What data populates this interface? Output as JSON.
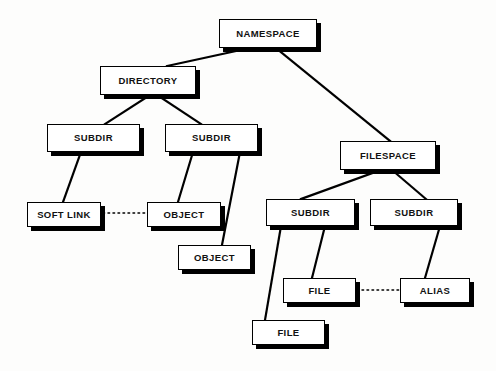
{
  "diagram": {
    "background_color": "#fdfdfc",
    "node_fill_color": "#ffffff",
    "node_border_color": "#000000",
    "node_shadow_color": "#000000",
    "edge_color": "#000000",
    "nodes": [
      {
        "id": "namespace",
        "label": "NAMESPACE",
        "x": 219,
        "y": 19,
        "w": 98,
        "h": 29
      },
      {
        "id": "directory",
        "label": "DIRECTORY",
        "x": 100,
        "y": 66,
        "w": 96,
        "h": 29
      },
      {
        "id": "subdir-a",
        "label": "SUBDIR",
        "x": 47,
        "y": 124,
        "w": 93,
        "h": 28
      },
      {
        "id": "subdir-b",
        "label": "SUBDIR",
        "x": 165,
        "y": 124,
        "w": 93,
        "h": 28
      },
      {
        "id": "filespace",
        "label": "FILESPACE",
        "x": 340,
        "y": 141,
        "w": 96,
        "h": 29
      },
      {
        "id": "soft-link",
        "label": "SOFT LINK",
        "x": 27,
        "y": 202,
        "w": 74,
        "h": 25
      },
      {
        "id": "object-a",
        "label": "OBJECT",
        "x": 147,
        "y": 202,
        "w": 74,
        "h": 25
      },
      {
        "id": "subdir-c",
        "label": "SUBDIR",
        "x": 266,
        "y": 199,
        "w": 89,
        "h": 27
      },
      {
        "id": "subdir-d",
        "label": "SUBDIR",
        "x": 370,
        "y": 199,
        "w": 88,
        "h": 27
      },
      {
        "id": "object-b",
        "label": "OBJECT",
        "x": 178,
        "y": 245,
        "w": 73,
        "h": 25
      },
      {
        "id": "file-a",
        "label": "FILE",
        "x": 283,
        "y": 278,
        "w": 73,
        "h": 25
      },
      {
        "id": "alias",
        "label": "ALIAS",
        "x": 400,
        "y": 278,
        "w": 70,
        "h": 25
      },
      {
        "id": "file-b",
        "label": "FILE",
        "x": 252,
        "y": 320,
        "w": 73,
        "h": 25
      }
    ],
    "edges": [
      {
        "id": "namespace-directory",
        "from": "namespace",
        "to": "directory",
        "style": "solid",
        "x1": 250,
        "y1": 48,
        "x2": 167,
        "y2": 66
      },
      {
        "id": "namespace-filespace",
        "from": "namespace",
        "to": "filespace",
        "style": "solid",
        "x1": 276,
        "y1": 48,
        "x2": 390,
        "y2": 141
      },
      {
        "id": "directory-subdir-a",
        "from": "directory",
        "to": "subdir-a",
        "style": "solid",
        "x1": 150,
        "y1": 95,
        "x2": 105,
        "y2": 124
      },
      {
        "id": "directory-subdir-b",
        "from": "directory",
        "to": "subdir-b",
        "style": "solid",
        "x1": 157,
        "y1": 95,
        "x2": 201,
        "y2": 124
      },
      {
        "id": "subdir-a-soft-link",
        "from": "subdir-a",
        "to": "soft-link",
        "style": "solid",
        "x1": 81,
        "y1": 152,
        "x2": 63,
        "y2": 202
      },
      {
        "id": "subdir-b-object-a",
        "from": "subdir-b",
        "to": "object-a",
        "style": "solid",
        "x1": 193,
        "y1": 152,
        "x2": 178,
        "y2": 202
      },
      {
        "id": "subdir-b-object-b",
        "from": "subdir-b",
        "to": "object-b",
        "style": "solid",
        "x1": 240,
        "y1": 152,
        "x2": 222,
        "y2": 245
      },
      {
        "id": "filespace-subdir-c",
        "from": "filespace",
        "to": "subdir-c",
        "style": "solid",
        "x1": 381,
        "y1": 170,
        "x2": 301,
        "y2": 199
      },
      {
        "id": "filespace-subdir-d",
        "from": "filespace",
        "to": "subdir-d",
        "style": "solid",
        "x1": 392,
        "y1": 170,
        "x2": 426,
        "y2": 199
      },
      {
        "id": "subdir-c-file-b",
        "from": "subdir-c",
        "to": "file-b",
        "style": "solid",
        "x1": 281,
        "y1": 226,
        "x2": 265,
        "y2": 320
      },
      {
        "id": "subdir-c-file-a",
        "from": "subdir-c",
        "to": "file-a",
        "style": "solid",
        "x1": 325,
        "y1": 226,
        "x2": 312,
        "y2": 278
      },
      {
        "id": "subdir-d-alias",
        "from": "subdir-d",
        "to": "alias",
        "style": "solid",
        "x1": 440,
        "y1": 226,
        "x2": 425,
        "y2": 278
      },
      {
        "id": "soft-link-object-a",
        "from": "soft-link",
        "to": "object-a",
        "style": "dotted",
        "x1": 103,
        "y1": 213,
        "x2": 146,
        "y2": 213
      },
      {
        "id": "file-a-alias",
        "from": "file-a",
        "to": "alias",
        "style": "dotted",
        "x1": 357,
        "y1": 290,
        "x2": 399,
        "y2": 290
      }
    ]
  }
}
